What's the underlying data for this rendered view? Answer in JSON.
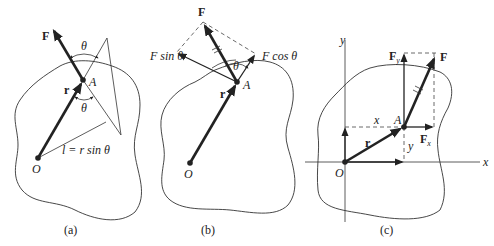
{
  "panels": {
    "a": {
      "caption": "(a)",
      "labels": {
        "force": "F",
        "position": "r",
        "point_a": "A",
        "origin": "O",
        "angle_top": "θ",
        "angle_bottom": "θ",
        "lever_arm": "l = r sin θ"
      }
    },
    "b": {
      "caption": "(b)",
      "labels": {
        "force": "F",
        "position": "r",
        "point_a": "A",
        "origin": "O",
        "angle": "θ",
        "perp_component": "F sin θ",
        "parallel_component": "F cos θ"
      }
    },
    "c": {
      "caption": "(c)",
      "labels": {
        "force": "F",
        "force_y": "F",
        "force_y_sub": "y",
        "force_x": "F",
        "force_x_sub": "x",
        "position": "r",
        "point_a": "A",
        "origin": "O",
        "coord_x": "x",
        "coord_y": "y",
        "axis_x": "x",
        "axis_y": "y"
      }
    }
  },
  "colors": {
    "ink": "#222222",
    "background": "#ffffff"
  }
}
